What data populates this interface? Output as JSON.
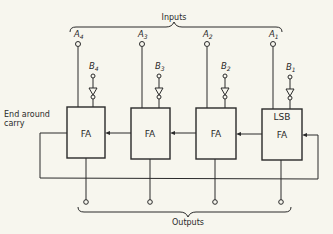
{
  "diagram": {
    "top_label": "Inputs",
    "bottom_label": "Outputs",
    "carry_label_line1": "End around",
    "carry_label_line2": "carry",
    "stages": [
      {
        "a": "A",
        "a_sub": "4",
        "b": "B",
        "b_sub": "4",
        "block": "FA",
        "extra": ""
      },
      {
        "a": "A",
        "a_sub": "3",
        "b": "B",
        "b_sub": "3",
        "block": "FA",
        "extra": ""
      },
      {
        "a": "A",
        "a_sub": "2",
        "b": "B",
        "b_sub": "2",
        "block": "FA",
        "extra": ""
      },
      {
        "a": "A",
        "a_sub": "1",
        "b": "B",
        "b_sub": "1",
        "block": "FA",
        "extra": "LSB"
      }
    ],
    "colors": {
      "line": "#2a2a2a",
      "background": "#f7f6ee"
    }
  }
}
